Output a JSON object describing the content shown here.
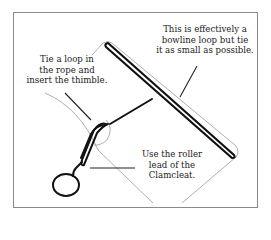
{
  "diagram": {
    "labels": {
      "thimble": [
        "Tie a loop in",
        "the rope and",
        "insert the thimble."
      ],
      "bowline": [
        "This is effectively a",
        "bowline loop but tie",
        "it as small as possible."
      ],
      "roller": [
        "Use the roller",
        "lead of the",
        "Clamcleat."
      ]
    },
    "colors": {
      "ink": "#111111",
      "guide": "#9a9a9a",
      "frame": "#8a8a8a"
    }
  }
}
